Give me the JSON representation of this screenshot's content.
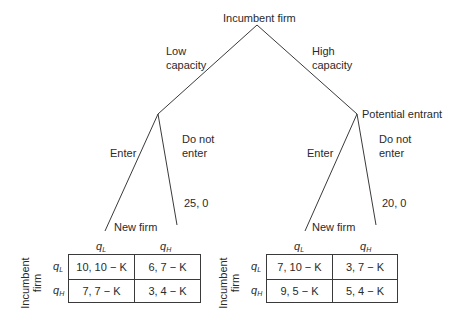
{
  "tree": {
    "root": {
      "player": "Incumbent firm"
    },
    "branches": {
      "low_capacity": {
        "label_line1": "Low",
        "label_line2": "capacity"
      },
      "high_capacity": {
        "label_line1": "High",
        "label_line2": "capacity"
      }
    },
    "left_node": {
      "enter": "Enter",
      "do_not_enter_line1": "Do not",
      "do_not_enter_line2": "enter",
      "do_not_enter_payoff": "25, 0",
      "new_firm": "New firm"
    },
    "right_node": {
      "player": "Potential entrant",
      "enter": "Enter",
      "do_not_enter_line1": "Do not",
      "do_not_enter_line2": "enter",
      "do_not_enter_payoff": "20, 0",
      "new_firm": "New firm"
    }
  },
  "matrices": {
    "row_player_line1": "Incumbent",
    "row_player_line2": "firm",
    "q_letter": "q",
    "col_headers": [
      {
        "sub": "L"
      },
      {
        "sub": "H"
      }
    ],
    "row_headers": [
      {
        "sub": "L"
      },
      {
        "sub": "H"
      }
    ],
    "left": {
      "cells": [
        [
          "10, 10 − K",
          "6, 7 − K"
        ],
        [
          "7, 7 − K",
          "3, 4 − K"
        ]
      ]
    },
    "right": {
      "cells": [
        [
          "7, 10 − K",
          "3, 7 − K"
        ],
        [
          "9, 5 − K",
          "5, 4 − K"
        ]
      ]
    }
  }
}
